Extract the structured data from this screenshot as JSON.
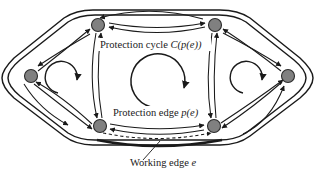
{
  "figure": {
    "background_color": "#ffffff",
    "width": 321,
    "height": 180
  },
  "style": {
    "node_fill": "#808080",
    "node_stroke": "#2b2b2b",
    "edge_color": "#1a1a1a",
    "boundary_color": "#1a1a1a",
    "working_edge_color": "#1a1a1a",
    "text_color": "#1a1a1a",
    "node_radius": 6.5
  },
  "labels": {
    "protection_cycle": {
      "text_plain": "Protection cycle ",
      "text_math": "C(p(e))",
      "full": "Protection cycle C(p(e))",
      "x": 100,
      "y": 48
    },
    "protection_edge": {
      "text_plain": "Protection edge ",
      "text_math": "p(e)",
      "full": "Protection edge p(e)",
      "x": 113,
      "y": 116
    },
    "working_edge": {
      "text_plain": "Working edge ",
      "text_math": "e",
      "full": "Working edge e",
      "x": 130,
      "y": 166
    }
  },
  "nodes": [
    {
      "id": "n-top-left",
      "name": "node-top-left",
      "cx": 98,
      "cy": 25
    },
    {
      "id": "n-top-right",
      "name": "node-top-right",
      "cx": 215,
      "cy": 25
    },
    {
      "id": "n-left",
      "name": "node-left",
      "cx": 31,
      "cy": 76
    },
    {
      "id": "n-right",
      "name": "node-right",
      "cx": 288,
      "cy": 76
    },
    {
      "id": "n-bottom-left",
      "name": "node-bottom-left",
      "cx": 100,
      "cy": 126
    },
    {
      "id": "n-bottom-right",
      "name": "node-bottom-right",
      "cx": 214,
      "cy": 126
    }
  ],
  "edges": {
    "top_pair": {
      "name": "edge-pair-top",
      "from": "n-top-left",
      "to": "n-top-right",
      "style": "lens-bidirectional"
    },
    "bottom_pair": {
      "name": "edge-pair-bottom",
      "from": "n-bottom-left",
      "to": "n-bottom-right",
      "style": "lens-bidirectional"
    },
    "left_pair": {
      "name": "edge-pair-left-vertical",
      "from": "n-top-left",
      "to": "n-bottom-left",
      "style": "lens-bidirectional"
    },
    "right_pair": {
      "name": "edge-pair-right-vertical",
      "from": "n-top-right",
      "to": "n-bottom-right",
      "style": "lens-bidirectional"
    },
    "left_diag_upper": {
      "name": "edge-left-upper-diagonal",
      "from": "n-left",
      "to": "n-top-left",
      "style": "curved-bidirectional"
    },
    "left_diag_lower": {
      "name": "edge-left-lower-diagonal",
      "from": "n-left",
      "to": "n-bottom-left",
      "style": "curved-bidirectional"
    },
    "right_diag_upper": {
      "name": "edge-right-upper-diagonal",
      "from": "n-right",
      "to": "n-top-right",
      "style": "curved-bidirectional"
    },
    "right_diag_lower": {
      "name": "edge-right-lower-diagonal",
      "from": "n-right",
      "to": "n-bottom-right",
      "style": "curved-bidirectional"
    },
    "working_edge": {
      "name": "working-edge",
      "from": "n-bottom-left",
      "to": "n-bottom-right",
      "style": "dashed",
      "has_thick_underline": true
    }
  },
  "rotation_arrows": [
    {
      "name": "rotation-arrow-left",
      "cx": 62,
      "cy": 77,
      "r": 16,
      "direction": "clockwise"
    },
    {
      "name": "rotation-arrow-center",
      "cx": 158,
      "cy": 80,
      "r": 27,
      "direction": "clockwise"
    },
    {
      "name": "rotation-arrow-right",
      "cx": 247,
      "cy": 77,
      "r": 16,
      "direction": "clockwise"
    }
  ],
  "boundary": {
    "name": "outer-hexagon-boundary",
    "shape": "hexagon",
    "style": "double-line"
  }
}
